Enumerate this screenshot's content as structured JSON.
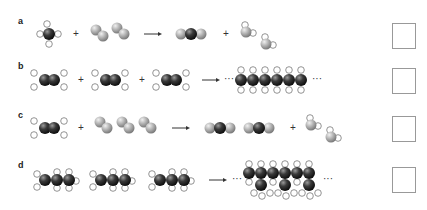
{
  "rows": [
    {
      "label": "a",
      "description": "CH4 + 2 O2 -> CO2 + 2 H2O",
      "plus_1": "+",
      "plus_2": "+",
      "answer_box": ""
    },
    {
      "label": "b",
      "description": "n C2H4 -> polyethylene chain",
      "plus_1": "+",
      "plus_2": "+",
      "ellipsis_left": "···",
      "ellipsis_right": "···",
      "answer_box": ""
    },
    {
      "label": "c",
      "description": "C2H4 + 3 O2 -> 2 CO2 + 2 H2O",
      "plus_1": "+",
      "plus_2": "+",
      "answer_box": ""
    },
    {
      "label": "d",
      "description": "n C3H6 -> polypropylene chain",
      "ellipsis_left": "···",
      "ellipsis_right": "···",
      "answer_box": ""
    }
  ],
  "colors": {
    "carbon": "#2a2a2a",
    "oxygen": "#a8a8a8",
    "hydrogen": "#ffffff",
    "box_border": "#999999"
  }
}
